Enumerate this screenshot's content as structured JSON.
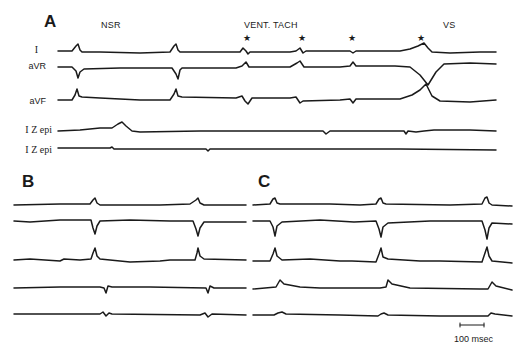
{
  "figure": {
    "panels": [
      {
        "letter": "A",
        "event_labels": {
          "nsr": "NSR",
          "vent_tach": "VENT. TACH",
          "vs": "VS",
          "marker": "★"
        },
        "leads": [
          "I",
          "aVR",
          "aVF",
          "I Z epi",
          "I Z epi"
        ]
      },
      {
        "letter": "B"
      },
      {
        "letter": "C"
      }
    ],
    "scale_bar": {
      "label": "100 msec"
    }
  }
}
